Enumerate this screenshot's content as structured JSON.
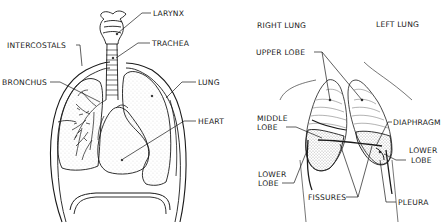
{
  "left_panel": {
    "title": "Frontal view of thorax",
    "labels": {
      "larynx": "LARYNX",
      "trachea": "TRACHEA",
      "intercostals": "INTERCOSTALS",
      "bronchus": "BRONCHUS",
      "lung": "LUNG",
      "heart": "HEART"
    }
  },
  "right_panel": {
    "title": "Lobes of the lungs",
    "labels": {
      "right_lung": "RIGHT LUNG",
      "left_lung": "LEFT LUNG",
      "upper_lobe": "UPPER LOBE",
      "middle_lobe_1": "MIDDLE",
      "middle_lobe_2": "LOBE",
      "diaphragm": "DIAPHRAGM",
      "lower_lobe_right_1": "LOWER",
      "lower_lobe_right_2": "LOBE",
      "lower_lobe_left_1": "LOWER",
      "lower_lobe_left_2": "LOBE",
      "fissures": "FISSURES",
      "pleura": "PLEURA"
    }
  },
  "colors": {
    "ink": "#1a1a1a",
    "paper": "#ffffff",
    "stipple": "#8a8a8a"
  }
}
